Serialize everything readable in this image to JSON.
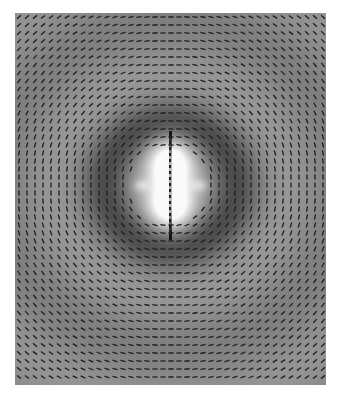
{
  "figure": {
    "background_color": "#ffffff",
    "plot_area": {
      "x": 15,
      "y": 13,
      "width": 311,
      "height": 372
    },
    "base_gray": "#8a8a8a",
    "vector_grid_spacing_px": 8,
    "vector_color": "#1e1e1e",
    "center": {
      "x": 170,
      "y": 185
    },
    "features": {
      "central_lobes": "two bright lobes above and below a vertical dipole axis",
      "side_lobes": "two small dark-centered lobes left and right of center",
      "rings": "concentric alternating dark/light elliptical wavefronts"
    }
  }
}
